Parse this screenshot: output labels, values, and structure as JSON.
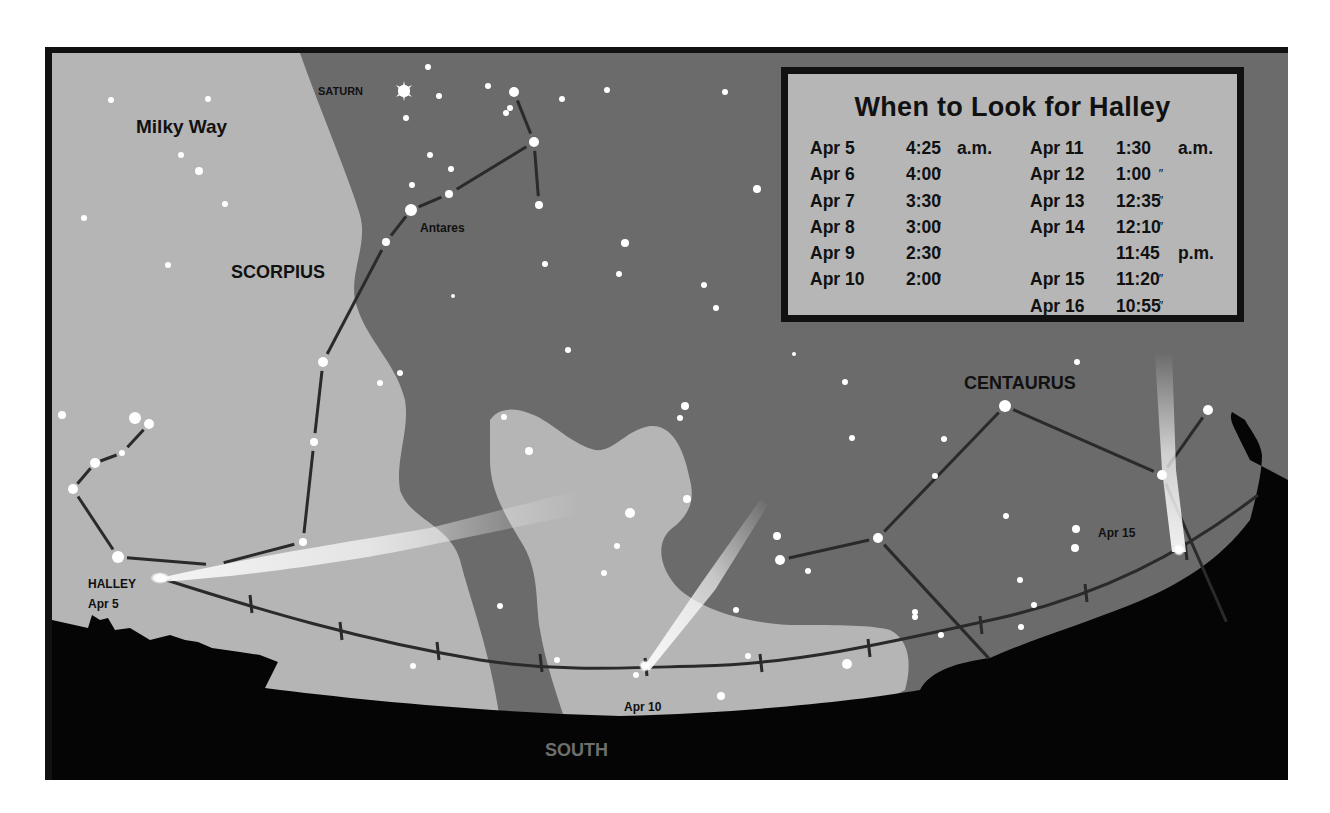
{
  "figure": {
    "colors": {
      "frame": "#111111",
      "milky_way": "#b5b5b5",
      "sky": "#6b6b6b",
      "ground": "#050505",
      "star": "#ffffff",
      "constellation_line": "#2a2a2a",
      "south_label": "#6e6e6e"
    }
  },
  "labels": {
    "milky_way": "Milky Way",
    "scorpius": "SCORPIUS",
    "saturn": "SATURN",
    "antares": "Antares",
    "centaurus": "CENTAURUS",
    "halley": "HALLEY",
    "halley_date": "Apr 5",
    "apr10": "Apr 10",
    "apr15": "Apr 15",
    "south": "SOUTH"
  },
  "info_box": {
    "title": "When to Look for Halley",
    "ditto": "″",
    "left": [
      {
        "date": "Apr 5",
        "time": "4:25",
        "ampm": "a.m.",
        "ditto": false
      },
      {
        "date": "Apr 6",
        "time": "4:00",
        "ampm": "",
        "ditto": true
      },
      {
        "date": "Apr 7",
        "time": "3:30",
        "ampm": "",
        "ditto": true
      },
      {
        "date": "Apr 8",
        "time": "3:00",
        "ampm": "",
        "ditto": true
      },
      {
        "date": "Apr 9",
        "time": "2:30",
        "ampm": "",
        "ditto": true
      },
      {
        "date": "Apr 10",
        "time": "2:00",
        "ampm": "",
        "ditto": true
      }
    ],
    "right": [
      {
        "date": "Apr 11",
        "time": "1:30",
        "ampm": "a.m.",
        "ditto": false
      },
      {
        "date": "Apr 12",
        "time": "1:00",
        "ampm": "",
        "ditto": true
      },
      {
        "date": "Apr 13",
        "time": "12:35",
        "ampm": "",
        "ditto": true
      },
      {
        "date": "Apr 14",
        "time": "12:10",
        "ampm": "",
        "ditto": true
      },
      {
        "date": "",
        "time": "11:45",
        "ampm": "p.m.",
        "ditto": false
      },
      {
        "date": "Apr 15",
        "time": "11:20",
        "ampm": "",
        "ditto": true
      },
      {
        "date": "Apr 16",
        "time": "10:55",
        "ampm": "",
        "ditto": true
      }
    ]
  },
  "comet_positions": [
    {
      "date": "Apr 5",
      "x": 160,
      "y": 578
    },
    {
      "date": "Apr 10",
      "x": 645,
      "y": 667
    },
    {
      "date": "Apr 15",
      "x": 1178,
      "y": 551
    }
  ],
  "stars": [
    [
      111,
      100,
      3
    ],
    [
      208,
      99,
      3
    ],
    [
      181,
      155,
      3
    ],
    [
      199,
      171,
      4
    ],
    [
      225,
      204,
      3
    ],
    [
      84,
      218,
      3
    ],
    [
      168,
      265,
      3
    ],
    [
      428,
      67,
      3
    ],
    [
      404,
      91,
      6
    ],
    [
      439,
      96,
      3
    ],
    [
      488,
      86,
      3
    ],
    [
      514,
      92,
      5
    ],
    [
      510,
      108,
      3
    ],
    [
      506,
      113,
      3
    ],
    [
      406,
      118,
      3
    ],
    [
      534,
      142,
      5
    ],
    [
      430,
      155,
      3
    ],
    [
      451,
      169,
      3
    ],
    [
      412,
      185,
      3
    ],
    [
      449,
      194,
      4
    ],
    [
      411,
      210,
      6
    ],
    [
      386,
      242,
      4
    ],
    [
      539,
      205,
      4
    ],
    [
      562,
      99,
      3
    ],
    [
      607,
      90,
      3
    ],
    [
      725,
      92,
      3
    ],
    [
      757,
      189,
      4
    ],
    [
      625,
      243,
      4
    ],
    [
      545,
      264,
      3
    ],
    [
      619,
      274,
      3
    ],
    [
      453,
      296,
      2
    ],
    [
      704,
      285,
      3
    ],
    [
      716,
      308,
      3
    ],
    [
      568,
      350,
      3
    ],
    [
      400,
      373,
      3
    ],
    [
      380,
      383,
      3
    ],
    [
      323,
      362,
      5
    ],
    [
      314,
      442,
      4
    ],
    [
      303,
      542,
      4
    ],
    [
      62,
      415,
      4
    ],
    [
      135,
      418,
      6
    ],
    [
      149,
      424,
      5
    ],
    [
      122,
      453,
      3
    ],
    [
      95,
      463,
      5
    ],
    [
      73,
      489,
      5
    ],
    [
      118,
      557,
      6
    ],
    [
      685,
      406,
      4
    ],
    [
      680,
      418,
      3
    ],
    [
      504,
      417,
      3
    ],
    [
      529,
      451,
      4
    ],
    [
      630,
      513,
      5
    ],
    [
      687,
      499,
      4
    ],
    [
      617,
      546,
      3
    ],
    [
      604,
      573,
      3
    ],
    [
      500,
      606,
      3
    ],
    [
      413,
      666,
      3
    ],
    [
      557,
      660,
      3
    ],
    [
      636,
      675,
      3
    ],
    [
      721,
      696,
      4
    ],
    [
      748,
      656,
      3
    ],
    [
      736,
      610,
      3
    ],
    [
      845,
      382,
      3
    ],
    [
      852,
      438,
      3
    ],
    [
      944,
      439,
      3
    ],
    [
      935,
      476,
      3
    ],
    [
      1005,
      406,
      6
    ],
    [
      1077,
      362,
      3
    ],
    [
      1208,
      410,
      5
    ],
    [
      777,
      536,
      4
    ],
    [
      780,
      560,
      5
    ],
    [
      808,
      571,
      3
    ],
    [
      878,
      538,
      5
    ],
    [
      915,
      612,
      3
    ],
    [
      915,
      617,
      3
    ],
    [
      941,
      635,
      3
    ],
    [
      1006,
      516,
      3
    ],
    [
      1076,
      529,
      4
    ],
    [
      1075,
      548,
      4
    ],
    [
      1034,
      605,
      3
    ],
    [
      1021,
      627,
      3
    ],
    [
      1020,
      580,
      3
    ],
    [
      847,
      664,
      5
    ],
    [
      1162,
      475,
      5
    ],
    [
      794,
      354,
      2
    ]
  ],
  "constellation_lines": [
    [
      [
        514,
        92
      ],
      [
        534,
        142
      ]
    ],
    [
      [
        534,
        142
      ],
      [
        539,
        205
      ]
    ],
    [
      [
        534,
        142
      ],
      [
        449,
        194
      ]
    ],
    [
      [
        449,
        194
      ],
      [
        411,
        210
      ]
    ],
    [
      [
        411,
        210
      ],
      [
        386,
        242
      ]
    ],
    [
      [
        386,
        242
      ],
      [
        323,
        362
      ]
    ],
    [
      [
        323,
        362
      ],
      [
        314,
        442
      ]
    ],
    [
      [
        314,
        442
      ],
      [
        303,
        542
      ]
    ],
    [
      [
        303,
        542
      ],
      [
        215,
        565
      ]
    ],
    [
      [
        118,
        557
      ],
      [
        215,
        565
      ]
    ],
    [
      [
        73,
        489
      ],
      [
        118,
        557
      ]
    ],
    [
      [
        73,
        489
      ],
      [
        95,
        463
      ]
    ],
    [
      [
        95,
        463
      ],
      [
        122,
        453
      ]
    ],
    [
      [
        122,
        453
      ],
      [
        149,
        424
      ]
    ],
    [
      [
        780,
        560
      ],
      [
        878,
        538
      ]
    ],
    [
      [
        878,
        538
      ],
      [
        1005,
        406
      ]
    ],
    [
      [
        1005,
        406
      ],
      [
        1162,
        475
      ]
    ],
    [
      [
        1162,
        475
      ],
      [
        1208,
        410
      ]
    ],
    [
      [
        878,
        538
      ],
      [
        995,
        665
      ]
    ],
    [
      [
        1162,
        475
      ],
      [
        1230,
        630
      ]
    ]
  ],
  "ecliptic_path": "M160,578 C260,610 360,640 480,660 C560,672 620,668 700,666 C800,664 900,640 1000,618 C1100,595 1180,555 1258,495",
  "ecliptic_ticks": [
    [
      250,
      604
    ],
    [
      340,
      631
    ],
    [
      437,
      651
    ],
    [
      540,
      663
    ],
    [
      645,
      667
    ],
    [
      760,
      663
    ],
    [
      868,
      648
    ],
    [
      980,
      625
    ],
    [
      1085,
      593
    ],
    [
      1185,
      551
    ]
  ]
}
